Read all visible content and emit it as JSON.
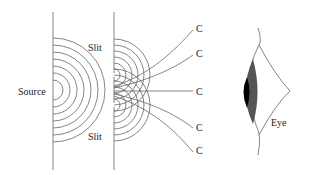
{
  "diagram": {
    "labels": {
      "source": "Source",
      "slit_top": "Slit",
      "slit_bottom": "Slit",
      "eye": "Eye",
      "c_labels": [
        "C",
        "C",
        "C",
        "C",
        "C"
      ]
    },
    "colors": {
      "line": "#555555",
      "iris": "#555555",
      "pupil": "#000000",
      "background": "#ffffff"
    }
  }
}
